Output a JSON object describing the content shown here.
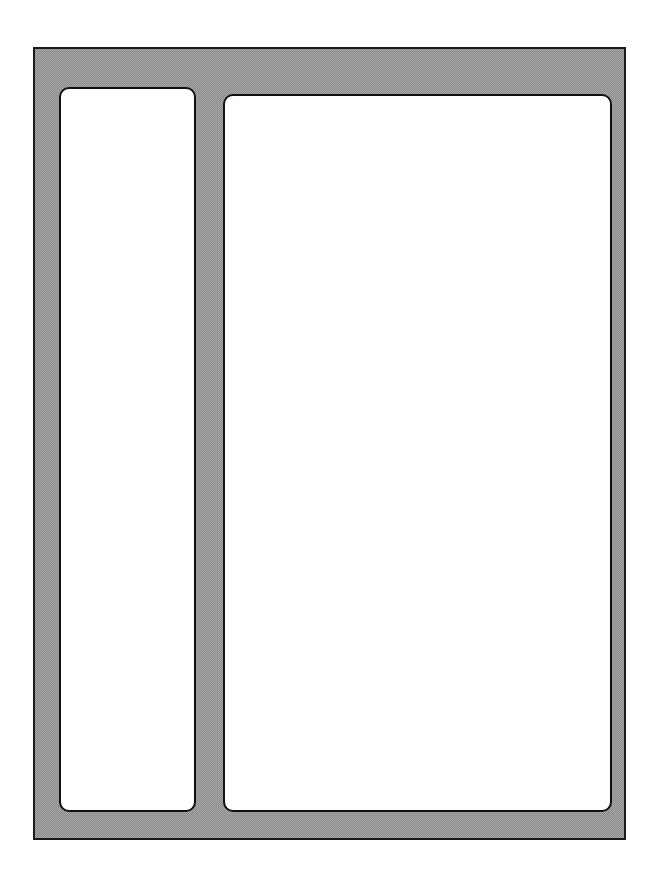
{
  "diagram": {
    "type": "layout-wireframe",
    "frame": {
      "fill": "#a8a8a8",
      "pattern": "halftone",
      "border_color": "#1a1a1a"
    },
    "panels": [
      {
        "id": "left",
        "role": "sidebar",
        "fill": "#ffffff",
        "border_color": "#111111",
        "content": ""
      },
      {
        "id": "right",
        "role": "main",
        "fill": "#ffffff",
        "border_color": "#111111",
        "content": ""
      }
    ]
  }
}
